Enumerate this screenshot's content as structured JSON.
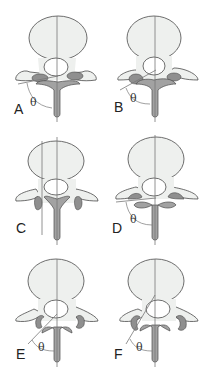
{
  "colors": {
    "bone_fill": "#eef0ee",
    "outline": "#4a4a4a",
    "facet_fill": "#8f8f8f",
    "lamina_fill": "#a2a2a2",
    "line": "#777777"
  },
  "panels": [
    {
      "label": "A",
      "angle_symbol": "θ"
    },
    {
      "label": "B",
      "angle_symbol": "θ"
    },
    {
      "label": "C",
      "angle_symbol": ""
    },
    {
      "label": "D",
      "angle_symbol": "θ"
    },
    {
      "label": "E",
      "angle_symbol": "θ"
    },
    {
      "label": "F",
      "angle_symbol": "θ"
    }
  ]
}
